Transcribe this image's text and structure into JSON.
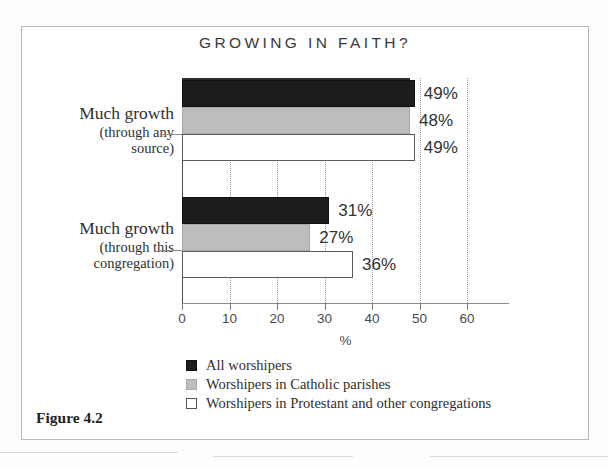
{
  "figure": {
    "caption": "Figure 4.2"
  },
  "chart_data": {
    "type": "bar",
    "orientation": "horizontal",
    "title": "GROWING IN FAITH?",
    "xlabel": "%",
    "ylabel": "",
    "xlim": [
      0,
      68
    ],
    "xticks": [
      0,
      10,
      20,
      30,
      40,
      50,
      60
    ],
    "xticklabels": [
      "0",
      "10",
      "20",
      "30",
      "40",
      "50",
      "60"
    ],
    "grid": true,
    "legend_position": "bottom",
    "categories": [
      {
        "line1": "Much growth",
        "line2": "(through any",
        "line3": "source)"
      },
      {
        "line1": "Much growth",
        "line2": "(through this",
        "line3": "congregation)"
      }
    ],
    "series": [
      {
        "name": "All worshipers",
        "color": "#1c1c1c",
        "values": [
          49,
          31
        ],
        "labels": [
          "49%",
          "31%"
        ]
      },
      {
        "name": "Worshipers in Catholic parishes",
        "color": "#bdbdbd",
        "values": [
          48,
          27
        ],
        "labels": [
          "48%",
          "27%"
        ]
      },
      {
        "name": "Worshipers in Protestant and other congregations",
        "color": "#ffffff",
        "values": [
          49,
          36
        ],
        "labels": [
          "49%",
          "36%"
        ]
      }
    ]
  }
}
